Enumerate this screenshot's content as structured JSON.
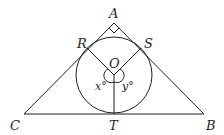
{
  "diagram": {
    "type": "geometry",
    "points": {
      "A": "A",
      "B": "B",
      "C": "C",
      "R": "R",
      "S": "S",
      "O": "O",
      "T": "T"
    },
    "angles": {
      "x": "x°",
      "y": "y°"
    }
  }
}
